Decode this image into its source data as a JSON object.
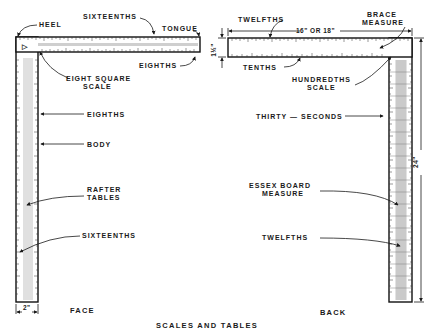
{
  "figure": {
    "caption": "SCALES AND TABLES",
    "colors": {
      "ink": "#1a1a1a",
      "paper": "#ffffff",
      "hatch": "#777777"
    }
  },
  "face": {
    "side_label": "FACE",
    "labels": {
      "heel": "HEEL",
      "sixteenths_top": "SIXTEENTHS",
      "tongue": "TONGUE",
      "eighths_tongue": "EIGHTHS",
      "eight_square_1": "EIGHT SQUARE",
      "eight_square_2": "SCALE",
      "eighths_body": "EIGHTHS",
      "body": "BODY",
      "rafter_1": "RAFTER",
      "rafter_2": "TABLES",
      "sixteenths_body": "SIXTEENTHS"
    },
    "dimensions": {
      "body_width": "2\""
    }
  },
  "back": {
    "side_label": "BACK",
    "labels": {
      "twelfths_top": "TWELFTHS",
      "brace_1": "BRACE",
      "brace_2": "MEASURE",
      "tenths": "TENTHS",
      "hundredths_1": "HUNDREDTHS",
      "hundredths_2": "SCALE",
      "thirty_seconds": "THIRTY — SECONDS",
      "essex_1": "ESSEX BOARD",
      "essex_2": "MEASURE",
      "twelfths_body": "TWELFTHS"
    },
    "dimensions": {
      "tongue_length": "16\" OR 18\"",
      "tongue_width": "1½\"",
      "body_length": "24\""
    }
  }
}
